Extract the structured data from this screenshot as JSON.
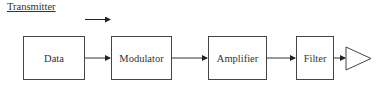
{
  "title": "Transmitter",
  "blocks": [
    {
      "id": "data",
      "label": "Data"
    },
    {
      "id": "modulator",
      "label": "Modulator"
    },
    {
      "id": "amplifier",
      "label": "Amplifier"
    },
    {
      "id": "filter",
      "label": "Filter"
    }
  ],
  "output_symbol": "antenna-triangle",
  "direction_indicator": "right-arrow",
  "colors": {
    "line": "#333333",
    "text": "#333333",
    "background": "#ffffff"
  }
}
